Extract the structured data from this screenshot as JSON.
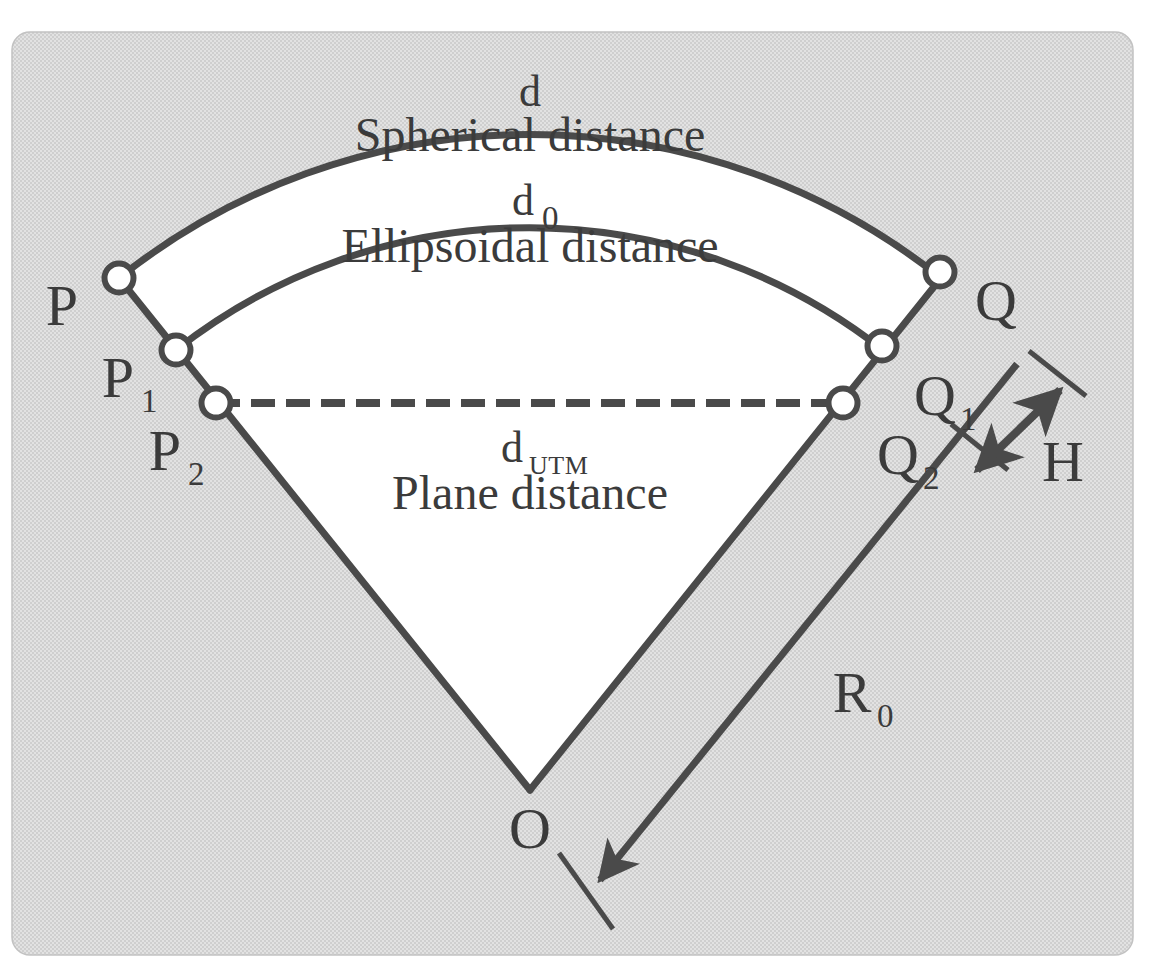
{
  "figure": {
    "panel": {
      "fill_color": "#dcdcdc",
      "border_color": "#c8c8c8",
      "corner_radius": 18,
      "x": 12,
      "y": 32,
      "width": 1121,
      "height": 923
    },
    "stroke_color": "#4a4a4a",
    "sector_fill_color": "#ffffff",
    "marker_fill_color": "#ffffff"
  },
  "arcs": [
    {
      "id": "spherical-arc",
      "symbol": "d",
      "name": "Spherical distance",
      "symbol_x": 530,
      "symbol_y": 96,
      "name_x": 530,
      "name_y": 139
    },
    {
      "id": "ellipsoidal-arc",
      "symbol": "d",
      "subscript": "0",
      "name": "Ellipsoidal distance",
      "symbol_x": 523,
      "symbol_y": 205,
      "name_x": 530,
      "name_y": 250
    },
    {
      "id": "plane-chord",
      "symbol": "d",
      "subscript": "UTM",
      "name": "Plane distance",
      "symbol_x": 515,
      "symbol_y": 452,
      "name_x": 530,
      "name_y": 497
    }
  ],
  "points": [
    {
      "id": "P",
      "label": "P",
      "subscript": "",
      "marker_x": 119,
      "marker_y": 278,
      "label_x": 62,
      "label_y": 310
    },
    {
      "id": "P1",
      "label": "P",
      "subscript": "1",
      "marker_x": 176,
      "marker_y": 350,
      "label_x": 118,
      "label_y": 382
    },
    {
      "id": "P2",
      "label": "P",
      "subscript": "2",
      "marker_x": 216,
      "marker_y": 403,
      "label_x": 165,
      "label_y": 455
    },
    {
      "id": "Q",
      "label": "Q",
      "subscript": "",
      "marker_x": 940,
      "marker_y": 272,
      "label_x": 996,
      "label_y": 305
    },
    {
      "id": "Q1",
      "label": "Q",
      "subscript": "1",
      "marker_x": 882,
      "marker_y": 346,
      "label_x": 935,
      "label_y": 400
    },
    {
      "id": "Q2",
      "label": "Q",
      "subscript": "2",
      "marker_x": 843,
      "marker_y": 403,
      "label_x": 898,
      "label_y": 459
    },
    {
      "id": "O",
      "label": "O",
      "subscript": "",
      "marker_x": 530,
      "marker_y": 790,
      "label_x": 530,
      "label_y": 833
    }
  ],
  "measures": [
    {
      "id": "radius",
      "label": "R",
      "subscript": "0",
      "label_x": 852,
      "label_y": 697
    },
    {
      "id": "height",
      "label": "H",
      "subscript": "",
      "label_x": 1063,
      "label_y": 466
    }
  ]
}
